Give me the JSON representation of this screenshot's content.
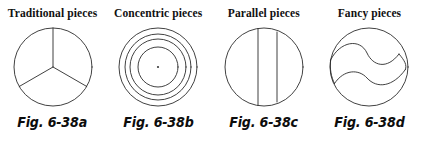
{
  "figure": {
    "caption_prefix": "Fig. 6-38",
    "background_color": "#ffffff",
    "line_color": "#2b2b2b",
    "panels": [
      {
        "title": "Traditional pieces",
        "caption": "Fig. 6-38a",
        "diagram": "circle-three-sectors",
        "diagram_description": "Circle divided into three equal pie sectors by radii at 90, 210 and 330 degrees"
      },
      {
        "title": "Concentric pieces",
        "caption": "Fig. 6-38b",
        "diagram": "circle-concentric-rings",
        "diagram_description": "Four concentric circles with a small dot at the center",
        "ring_count": 4
      },
      {
        "title": "Parallel pieces",
        "caption": "Fig. 6-38c",
        "diagram": "circle-parallel-chords",
        "diagram_description": "Circle crossed by two vertical parallel chords",
        "chord_count": 2
      },
      {
        "title": "Fancy pieces",
        "caption": "Fig. 6-38d",
        "diagram": "circle-s-curves",
        "diagram_description": "Circle crossed by two parallel S-shaped curves forming a curved band",
        "curve_count": 2
      }
    ]
  }
}
